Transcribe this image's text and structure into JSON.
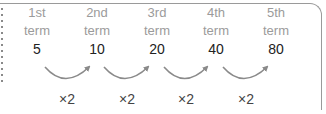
{
  "terms": [
    {
      "ordinal": "1st",
      "word": "term",
      "value": "5"
    },
    {
      "ordinal": "2nd",
      "word": "term",
      "value": "10"
    },
    {
      "ordinal": "3rd",
      "word": "term",
      "value": "20"
    },
    {
      "ordinal": "4th",
      "word": "term",
      "value": "40"
    },
    {
      "ordinal": "5th",
      "word": "term",
      "value": "80"
    }
  ],
  "multipliers": [
    "×2",
    "×2",
    "×2",
    "×2"
  ],
  "colors": {
    "label": "#9b9b9b",
    "number": "#222222",
    "arrow": "#8a8a8a",
    "border": "#9a9a9a"
  }
}
